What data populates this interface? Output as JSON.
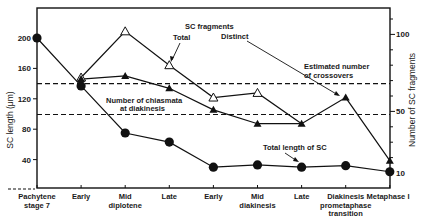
{
  "chart_data": {
    "type": "line",
    "title": "",
    "xlabel": "",
    "ylabel": "SC length (μm)",
    "ylabel_right": "Number of SC fragments",
    "ylim": [
      0,
      220
    ],
    "ylim_right": [
      0,
      110
    ],
    "left_ticks": [
      "200",
      "160",
      "120",
      "80",
      "40"
    ],
    "right_ticks": [
      "100",
      "50",
      "10"
    ],
    "categories": [
      [
        "Pachytene",
        "stage 7"
      ],
      [
        "Early"
      ],
      [
        "Mid",
        "diplotene"
      ],
      [
        "Late"
      ],
      [
        "Early"
      ],
      [
        "Mid",
        "diakinesis"
      ],
      [
        "Late"
      ],
      [
        "Diakinesis",
        "prometaphase",
        "transition"
      ],
      [
        "Metaphase I"
      ]
    ],
    "series": [
      {
        "name": "Total length of SC",
        "axis": "left",
        "marker": "filled-circle",
        "values": [
          200,
          137,
          75,
          63,
          30,
          33,
          30,
          32,
          24
        ]
      },
      {
        "name": "SC fragments - Total",
        "axis": "right",
        "marker": "open-triangle",
        "values": [
          null,
          72,
          102,
          80,
          59,
          62,
          null,
          null,
          null
        ]
      },
      {
        "name": "SC fragments - Distinct",
        "axis": "right",
        "marker": "filled-triangle",
        "values": [
          null,
          71,
          73,
          65,
          51,
          42,
          42,
          59,
          18
        ]
      }
    ],
    "reference_lines": [
      {
        "name": "Estimated number of crossovers",
        "axis": "right",
        "value": 68,
        "style": "dashed"
      },
      {
        "name": "Number of chiasmata at diakinesis",
        "axis": "right",
        "value": 48,
        "style": "dashed"
      }
    ],
    "annotations": {
      "sc_fragments": "SC fragments",
      "total": "Total",
      "distinct": "Distinct",
      "crossovers_1": "Estimated number",
      "crossovers_2": "of crossovers",
      "chiasmata_1": "Number of chiasmata",
      "chiasmata_2": "at diakinesis",
      "total_length": "Total length of SC"
    },
    "grid": false,
    "legend": "inline annotations"
  }
}
